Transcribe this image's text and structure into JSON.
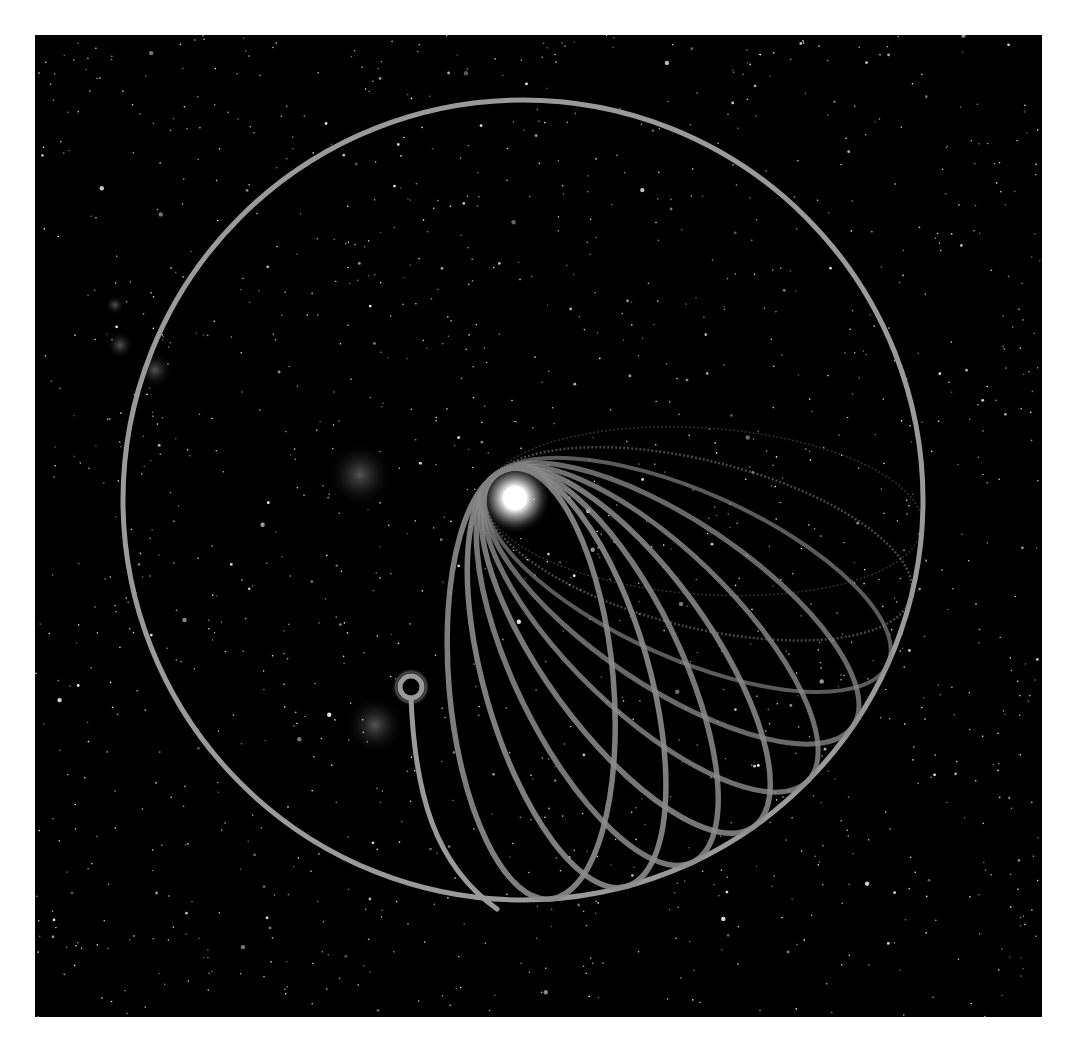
{
  "figure": {
    "background_color": "#000000",
    "frame": {
      "x": 35,
      "y": 35,
      "width": 1007,
      "height": 982
    }
  },
  "outer_circle": {
    "cx": 488,
    "cy": 465,
    "r": 400,
    "stroke": "#9a9a9a",
    "stroke_width": 5
  },
  "central_star": {
    "cx": 480,
    "cy": 463,
    "r": 22,
    "glow_r": 36,
    "color": "#ffffff"
  },
  "orbits": [
    {
      "angle": 4,
      "width": 1.5,
      "opacity": 0.35,
      "dashed": true
    },
    {
      "angle": 14,
      "width": 2.5,
      "opacity": 0.5,
      "dashed": true
    },
    {
      "angle": 24,
      "width": 4,
      "opacity": 0.65,
      "dashed": false
    },
    {
      "angle": 34,
      "width": 5,
      "opacity": 0.75,
      "dashed": false
    },
    {
      "angle": 44,
      "width": 5,
      "opacity": 0.8,
      "dashed": false
    },
    {
      "angle": 54,
      "width": 5.5,
      "opacity": 0.85,
      "dashed": false
    },
    {
      "angle": 64,
      "width": 5.5,
      "opacity": 0.85,
      "dashed": false
    },
    {
      "angle": 74,
      "width": 5.5,
      "opacity": 0.9,
      "dashed": false
    },
    {
      "angle": 85,
      "width": 5.5,
      "opacity": 0.9,
      "dashed": false
    }
  ],
  "orbit_style": {
    "stroke": "#8c8c8c",
    "semi_minor_ratio": 0.38
  },
  "trajectory": {
    "start_marker": {
      "cx": 376,
      "cy": 652,
      "r": 11,
      "stroke_width": 5
    },
    "path": "M 376 663 C 380 760, 400 830, 462 874",
    "stroke": "#9a9a9a",
    "stroke_width": 5
  },
  "nebulae": [
    {
      "cx": 120,
      "cy": 335,
      "r": 18
    },
    {
      "cx": 85,
      "cy": 310,
      "r": 14
    },
    {
      "cx": 80,
      "cy": 270,
      "r": 10
    },
    {
      "cx": 325,
      "cy": 440,
      "r": 34
    },
    {
      "cx": 340,
      "cy": 690,
      "r": 30
    }
  ],
  "star_seed": 1977,
  "star_count": 1400
}
